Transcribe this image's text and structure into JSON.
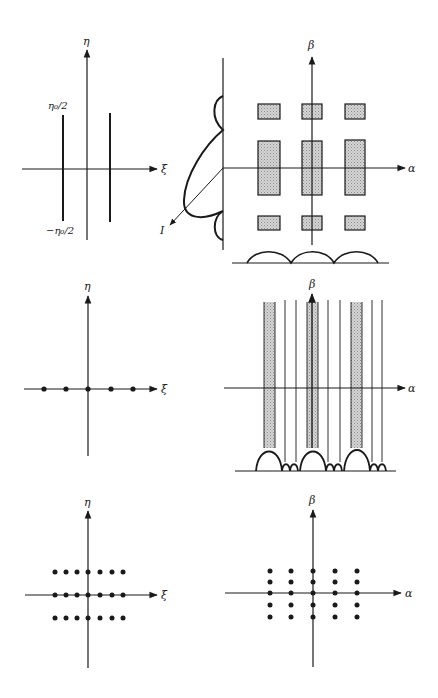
{
  "colors": {
    "ink": "#1a1a1a",
    "shade": "#c8c8c8",
    "background": "#ffffff"
  },
  "panels": {
    "top_left": {
      "description": "Object: two vertical slits",
      "axis_x_label": "ξ",
      "axis_y_label": "η",
      "upper_label": "η₀/2",
      "lower_label": "−η₀/2"
    },
    "top_right": {
      "description": "Diffraction pattern of two slits with intensity profiles",
      "axis_x_label": "α",
      "axis_y_label": "β",
      "intensity_label": "I",
      "box_columns": 3,
      "box_rows": 3
    },
    "middle_left": {
      "description": "Object: five points on ξ axis",
      "axis_x_label": "ξ",
      "axis_y_label": "η",
      "dot_count": 5
    },
    "middle_right": {
      "description": "Diffraction pattern: vertical fringes with main/secondary maxima",
      "axis_x_label": "α",
      "axis_y_label": "β",
      "shaded_strips": 3,
      "thin_lines": 6
    },
    "bottom_left": {
      "description": "Object: 3×7 point array",
      "axis_x_label": "ξ",
      "axis_y_label": "η",
      "rows": 3,
      "cols": 7
    },
    "bottom_right": {
      "description": "Diffraction pattern: 5×5 point array",
      "axis_x_label": "α",
      "axis_y_label": "β",
      "rows": 5,
      "cols": 5
    }
  }
}
